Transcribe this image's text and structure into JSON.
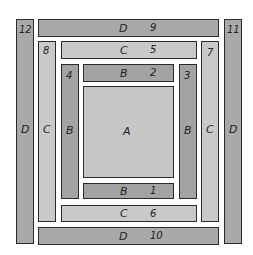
{
  "diagram": {
    "center": {
      "letter": "A"
    },
    "strips": [
      {
        "number": "1",
        "letter": "B",
        "position": "bottom"
      },
      {
        "number": "2",
        "letter": "B",
        "position": "top"
      },
      {
        "number": "3",
        "letter": "B",
        "position": "right"
      },
      {
        "number": "4",
        "letter": "B",
        "position": "left"
      },
      {
        "number": "5",
        "letter": "C",
        "position": "top"
      },
      {
        "number": "6",
        "letter": "C",
        "position": "bottom"
      },
      {
        "number": "7",
        "letter": "C",
        "position": "right"
      },
      {
        "number": "8",
        "letter": "C",
        "position": "left"
      },
      {
        "number": "9",
        "letter": "D",
        "position": "top"
      },
      {
        "number": "10",
        "letter": "D",
        "position": "bottom"
      },
      {
        "number": "11",
        "letter": "D",
        "position": "right"
      },
      {
        "number": "12",
        "letter": "D",
        "position": "left"
      }
    ],
    "colors": {
      "layer_D": "#a9a9a9",
      "layer_C": "#c9c9c9",
      "layer_B": "#a3a3a3",
      "center_A": "#c6c6c6",
      "outline": "#2a2a2a"
    }
  }
}
